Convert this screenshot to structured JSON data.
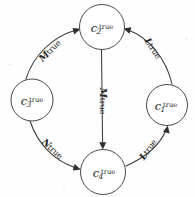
{
  "diagram": {
    "type": "directed-cycle-graph",
    "background_color": "#fefefe",
    "stroke_color": "#3a3a3a",
    "text_color": "#1d1d1d",
    "nodes": [
      {
        "id": "c2",
        "base": "c",
        "subscript": "2",
        "superscript": "true",
        "position": "top",
        "cx": 102,
        "cy": 27,
        "r": 22.5
      },
      {
        "id": "c1",
        "base": "c",
        "subscript": "1",
        "superscript": "true",
        "position": "right",
        "cx": 167,
        "cy": 105,
        "r": 20.5
      },
      {
        "id": "c4",
        "base": "c",
        "subscript": "4",
        "superscript": "true",
        "position": "bottom",
        "cx": 103,
        "cy": 172,
        "r": 22.5
      },
      {
        "id": "c3",
        "base": "c",
        "subscript": "3",
        "superscript": "true",
        "position": "left",
        "cx": 32,
        "cy": 100,
        "r": 21.0
      }
    ],
    "edges": [
      {
        "id": "edge-c3-c2",
        "from": "c3",
        "to": "c2",
        "script": "M",
        "word": "true",
        "label_x": 48,
        "label_y": 49,
        "label_rotation": -46
      },
      {
        "id": "edge-c1-c2",
        "from": "c1",
        "to": "c2",
        "script": "L",
        "word": "true",
        "label_x": 155,
        "label_y": 47,
        "label_rotation": 57
      },
      {
        "id": "edge-c2-c4",
        "from": "c2",
        "to": "c4",
        "script": "M",
        "word": "true",
        "label_x": 105,
        "label_y": 101,
        "label_rotation": 90
      },
      {
        "id": "edge-c3-c4",
        "from": "c3",
        "to": "c4",
        "script": "N",
        "word": "true",
        "label_x": 54,
        "label_y": 147,
        "label_rotation": 42
      },
      {
        "id": "edge-c4-c1",
        "from": "c4",
        "to": "c1",
        "script": "L",
        "word": "true",
        "label_x": 146,
        "label_y": 148,
        "label_rotation": -55
      }
    ]
  }
}
